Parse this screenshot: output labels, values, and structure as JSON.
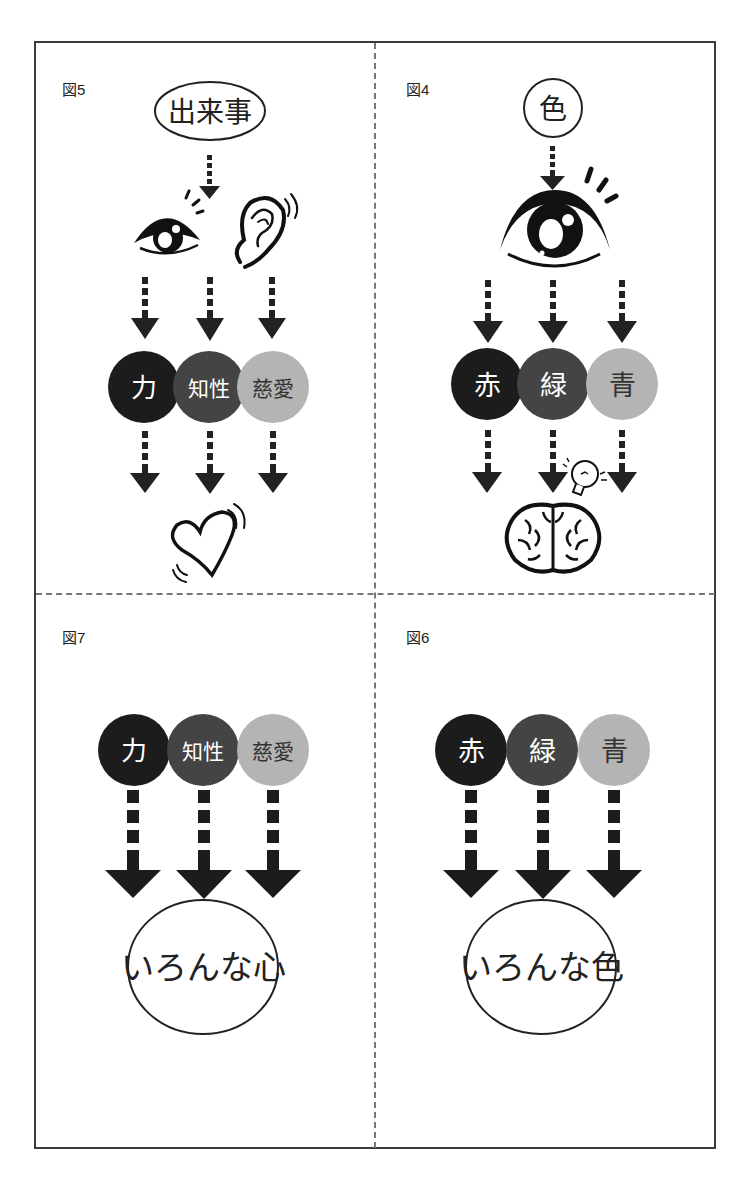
{
  "colors": {
    "dark": "#1c1c1c",
    "mid": "#444444",
    "light": "#b4b4b4",
    "ink": "#222222",
    "divider": "#777777"
  },
  "panels": {
    "top_left": {
      "label": "図5",
      "source": "出来事",
      "icons": [
        "eye-icon",
        "ear-icon"
      ],
      "circles": [
        {
          "text": "力",
          "shade": "dark"
        },
        {
          "text": "知性",
          "shade": "mid"
        },
        {
          "text": "慈愛",
          "shade": "light"
        }
      ],
      "result_icon": "heart-icon"
    },
    "top_right": {
      "label": "図4",
      "source": "色",
      "icons": [
        "eye-icon"
      ],
      "circles": [
        {
          "text": "赤",
          "shade": "dark"
        },
        {
          "text": "緑",
          "shade": "mid"
        },
        {
          "text": "青",
          "shade": "light"
        }
      ],
      "result_icon": "brain-icon",
      "extra_icon": "lightbulb-icon"
    },
    "bottom_left": {
      "label": "図7",
      "circles": [
        {
          "text": "力",
          "shade": "dark"
        },
        {
          "text": "知性",
          "shade": "mid"
        },
        {
          "text": "慈愛",
          "shade": "light"
        }
      ],
      "result": "いろんな心"
    },
    "bottom_right": {
      "label": "図6",
      "circles": [
        {
          "text": "赤",
          "shade": "dark"
        },
        {
          "text": "緑",
          "shade": "mid"
        },
        {
          "text": "青",
          "shade": "light"
        }
      ],
      "result": "いろんな色"
    }
  }
}
